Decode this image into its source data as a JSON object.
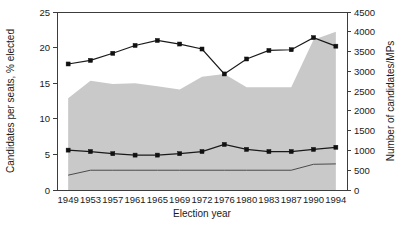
{
  "chart_data": {
    "type": "line",
    "title": "",
    "xlabel": "Election year",
    "ylabel": "Candidates per seats, % elected",
    "ylabel_right": "Number of candidates/MPs",
    "categories": [
      "1949",
      "1953",
      "1957",
      "1961",
      "1965",
      "1969",
      "1972",
      "1976",
      "1980",
      "1983",
      "1987",
      "1990",
      "1994"
    ],
    "ylim": [
      0,
      25
    ],
    "yticks": [
      "0",
      "5",
      "10",
      "15",
      "20",
      "25"
    ],
    "ylim_right": [
      0,
      4500
    ],
    "yticks_right": [
      "0",
      "500",
      "1000",
      "1500",
      "2000",
      "2500",
      "3000",
      "3500",
      "4000",
      "4500"
    ],
    "grid": false,
    "legend": "none",
    "series": [
      {
        "name": "Candidates per seat",
        "axis": "left",
        "style": "line-marker",
        "color": "#111111",
        "values": [
          17.7,
          18.2,
          19.2,
          20.3,
          21.0,
          20.5,
          19.8,
          16.3,
          18.4,
          19.6,
          19.7,
          21.4,
          20.2
        ]
      },
      {
        "name": "Percent elected",
        "axis": "left",
        "style": "line-marker",
        "color": "#111111",
        "values": [
          5.6,
          5.4,
          5.1,
          4.9,
          4.9,
          5.1,
          5.4,
          6.4,
          5.7,
          5.4,
          5.4,
          5.7,
          6.0
        ]
      },
      {
        "name": "Number of candidates",
        "axis": "right",
        "style": "area",
        "color": "#c9c9c9",
        "values": [
          2320,
          2760,
          2680,
          2700,
          2620,
          2540,
          2860,
          2930,
          2600,
          2600,
          2600,
          3800,
          4000
        ]
      },
      {
        "name": "Number of MPs",
        "axis": "right",
        "style": "thin-line",
        "color": "#4a4a4a",
        "values": [
          375,
          500,
          500,
          500,
          500,
          500,
          500,
          500,
          500,
          500,
          500,
          650,
          660
        ]
      }
    ]
  }
}
